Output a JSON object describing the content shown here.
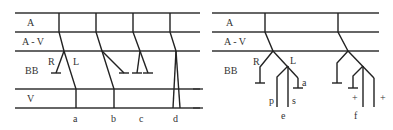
{
  "left_panel": {
    "rows": [
      "A",
      "A - V",
      "BB",
      "V"
    ],
    "branch_labels": {
      "right": "R",
      "left": "L"
    },
    "patterns": [
      "a",
      "b",
      "c",
      "d"
    ]
  },
  "right_panel": {
    "rows": [
      "A",
      "A - V",
      "BB"
    ],
    "branch_labels": {
      "right": "R",
      "left": "L"
    },
    "sub_labels": {
      "p": "p",
      "s": "s",
      "a": "a",
      "plus1": "+",
      "plus2": "+"
    },
    "patterns": [
      "e",
      "f"
    ]
  }
}
